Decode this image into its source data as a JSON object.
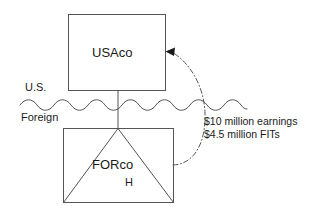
{
  "diagram": {
    "background_color": "#ffffff",
    "line_color": "#555555",
    "text_color": "#1a1a1a",
    "entities": {
      "parent": {
        "label": "USAco"
      },
      "subsidiary": {
        "label": "FORco",
        "sub_label": "H"
      }
    },
    "regions": {
      "above_border": "U.S.",
      "below_border": "Foreign"
    },
    "annotation": {
      "line1": "$10 million earnings",
      "line2": "$4.5 million FITs"
    },
    "connectors": {
      "ownership_line": "vertical-solid-line",
      "border": "wavy-line",
      "flow_arrow": "dash-dot-curved-arrow"
    }
  }
}
